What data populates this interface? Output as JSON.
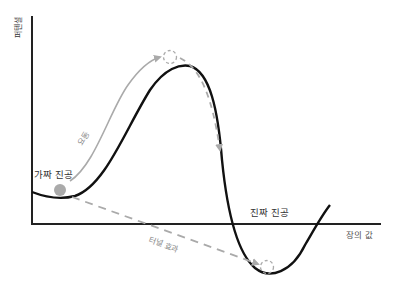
{
  "diagram": {
    "y_axis_label": "퍼텐셜",
    "x_axis_label": "장의 값",
    "labels": {
      "false_vacuum": "가짜 진공",
      "true_vacuum": "진짜 진공",
      "fluctuation": "요동",
      "tunneling": "터널 효과"
    },
    "colors": {
      "axis": "#222222",
      "curve": "#111111",
      "path": "#aaaaaa",
      "ball": "#aaaaaa",
      "text": "#333333",
      "muted_text": "#888888"
    }
  }
}
